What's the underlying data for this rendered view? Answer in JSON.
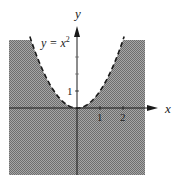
{
  "chart_data": {
    "type": "area",
    "title": "",
    "xlabel": "x",
    "ylabel": "y",
    "curve": {
      "label": "y = x²",
      "equation": "y = x^2",
      "style": "dashed",
      "x": [
        -2,
        -1.5,
        -1,
        -0.5,
        0,
        0.5,
        1,
        1.5,
        2
      ],
      "y": [
        4,
        2.25,
        1,
        0.25,
        0,
        0.25,
        1,
        2.25,
        4
      ]
    },
    "shaded_region": "y < x^2",
    "x_ticks": [
      1,
      2
    ],
    "y_ticks": [
      1
    ],
    "xlim": [
      -3.1,
      2.9
    ],
    "ylim": [
      -4,
      4
    ],
    "grid": false,
    "legend": null
  },
  "labels": {
    "x_axis": "x",
    "y_axis": "y",
    "curve_label_base": "y = x",
    "curve_label_exp": "2",
    "x_tick_1": "1",
    "x_tick_2": "2",
    "y_tick_1": "1"
  },
  "colors": {
    "shade": "#8c8c8c",
    "curve": "#1a1a1a",
    "axis": "#1a1a1a"
  }
}
